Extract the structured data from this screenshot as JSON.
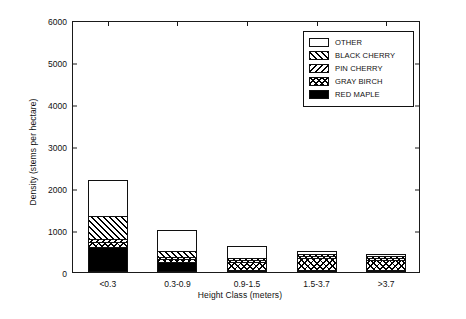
{
  "chart_data": {
    "type": "bar",
    "subtype": "stacked",
    "title": "",
    "xlabel": "Height Class (meters)",
    "ylabel": "Density (stems per hectare)",
    "categories": [
      "<0.3",
      "0.3-0.9",
      "0.9-1.5",
      "1.5-3.7",
      ">3.7"
    ],
    "ylim": [
      0,
      6000
    ],
    "yticks": [
      0,
      1000,
      2000,
      3000,
      4000,
      5000,
      6000
    ],
    "ytick_labels": [
      "0",
      "1000",
      "2000",
      "3000",
      "4000",
      "5000",
      "6000"
    ],
    "grid": false,
    "legend_position": "upper right",
    "stack_order_bottom_to_top": [
      "RED MAPLE",
      "GRAY BIRCH",
      "PIN CHERRY",
      "BLACK CHERRY",
      "OTHER"
    ],
    "series": [
      {
        "name": "RED MAPLE",
        "pattern": "solid-black",
        "values": [
          600,
          250,
          50,
          25,
          20
        ]
      },
      {
        "name": "GRAY BIRCH",
        "pattern": "cross-hatch",
        "values": [
          120,
          70,
          200,
          280,
          230
        ]
      },
      {
        "name": "PIN CHERRY",
        "pattern": "backward-diagonal",
        "values": [
          60,
          40,
          30,
          10,
          10
        ]
      },
      {
        "name": "BLACK CHERRY",
        "pattern": "forward-diagonal",
        "values": [
          560,
          130,
          30,
          10,
          10
        ]
      },
      {
        "name": "OTHER",
        "pattern": "empty-white",
        "values": [
          850,
          510,
          285,
          80,
          60
        ]
      }
    ],
    "totals": [
      2190,
      1000,
      595,
      405,
      330
    ]
  },
  "legend": {
    "items": [
      {
        "label": "OTHER",
        "pattern": "empty-white"
      },
      {
        "label": "BLACK CHERRY",
        "pattern": "forward-diagonal"
      },
      {
        "label": "PIN CHERRY",
        "pattern": "backward-diagonal"
      },
      {
        "label": "GRAY BIRCH",
        "pattern": "cross-hatch"
      },
      {
        "label": "RED MAPLE",
        "pattern": "solid-black"
      }
    ]
  },
  "colors": {
    "axis": "#1a1a1a",
    "fill_dark": "#000000",
    "fill_light": "#ffffff",
    "background": "#ffffff"
  }
}
